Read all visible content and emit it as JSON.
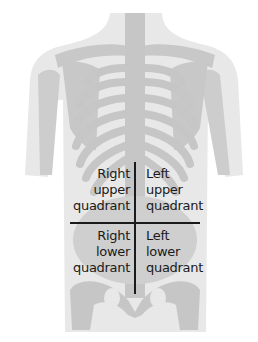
{
  "diagram": {
    "colors": {
      "background": "#ffffff",
      "body_fill": "#e8e8e8",
      "bone_fill": "#c8c8c8",
      "divider_lines": "#1a1a1a",
      "label_text": "#1a1a1a"
    },
    "quadrants": [
      {
        "id": "ruq",
        "lines": [
          "Right",
          "upper",
          "quadrant"
        ]
      },
      {
        "id": "luq",
        "lines": [
          "Left",
          "upper",
          "quadrant"
        ]
      },
      {
        "id": "rlq",
        "lines": [
          "Right",
          "lower",
          "quadrant"
        ]
      },
      {
        "id": "llq",
        "lines": [
          "Left",
          "lower",
          "quadrant"
        ]
      }
    ]
  }
}
